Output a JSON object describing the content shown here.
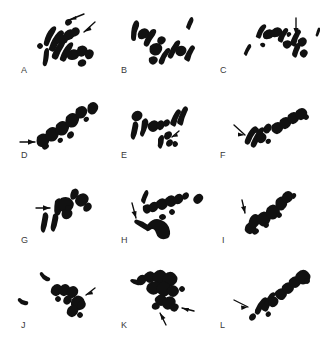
{
  "figure": {
    "width": 330,
    "height": 340,
    "background_color": "#ffffff",
    "ink_color": "#111111",
    "label_color": "#3a3a3a",
    "grid": {
      "columns": 3,
      "rows": 4
    },
    "panel_count": 12
  },
  "panels": [
    {
      "id": "A",
      "label": "A",
      "label_x": 21,
      "label_y": 72,
      "origin_x": 0,
      "origin_y": 0,
      "arrow_count": 2,
      "chromosome_count": 14,
      "spread_angle_deg": -32,
      "description": "metaphase chromosome spread with two arrows indicating marker chromosomes"
    },
    {
      "id": "B",
      "label": "B",
      "label_x": 121,
      "label_y": 72,
      "origin_x": 110,
      "origin_y": 0,
      "arrow_count": 0,
      "chromosome_count": 11,
      "spread_angle_deg": -28,
      "description": "metaphase chromosome spread, scattered elements"
    },
    {
      "id": "C",
      "label": "C",
      "label_x": 220,
      "label_y": 72,
      "origin_x": 220,
      "origin_y": 0,
      "arrow_count": 1,
      "chromosome_count": 13,
      "spread_angle_deg": -25,
      "description": "metaphase chromosome spread with one downward arrow"
    },
    {
      "id": "D",
      "label": "D",
      "label_x": 21,
      "label_y": 155,
      "origin_x": 0,
      "origin_y": 85,
      "arrow_count": 1,
      "chromosome_count": 10,
      "spread_angle_deg": -38,
      "description": "metaphase chromosome spread with one horizontal arrow from left"
    },
    {
      "id": "E",
      "label": "E",
      "label_x": 121,
      "label_y": 155,
      "origin_x": 110,
      "origin_y": 85,
      "arrow_count": 1,
      "chromosome_count": 12,
      "spread_angle_deg": -20,
      "description": "metaphase chromosome spread with small arrow at lower right"
    },
    {
      "id": "F",
      "label": "F",
      "label_x": 220,
      "label_y": 155,
      "origin_x": 220,
      "origin_y": 85,
      "arrow_count": 1,
      "chromosome_count": 11,
      "spread_angle_deg": -30,
      "description": "metaphase chromosome spread with diagonal arrow from lower left"
    },
    {
      "id": "G",
      "label": "G",
      "label_x": 21,
      "label_y": 240,
      "origin_x": 0,
      "origin_y": 170,
      "arrow_count": 1,
      "chromosome_count": 9,
      "spread_angle_deg": -15,
      "description": "metaphase chromosome spread with horizontal arrow from left"
    },
    {
      "id": "H",
      "label": "H",
      "label_x": 121,
      "label_y": 240,
      "origin_x": 110,
      "origin_y": 170,
      "arrow_count": 2,
      "chromosome_count": 12,
      "spread_angle_deg": -22,
      "description": "metaphase chromosome spread with downward arrow and large curved marker"
    },
    {
      "id": "I",
      "label": "I",
      "label_x": 222,
      "label_y": 240,
      "origin_x": 220,
      "origin_y": 170,
      "arrow_count": 1,
      "chromosome_count": 10,
      "spread_angle_deg": -40,
      "description": "metaphase chromosome spread with short downward arrow"
    },
    {
      "id": "J",
      "label": "J",
      "label_x": 21,
      "label_y": 322,
      "origin_x": 0,
      "origin_y": 255,
      "arrow_count": 1,
      "chromosome_count": 11,
      "spread_angle_deg": -35,
      "description": "metaphase chromosome spread with arrow at right side"
    },
    {
      "id": "K",
      "label": "K",
      "label_x": 121,
      "label_y": 322,
      "origin_x": 110,
      "origin_y": 255,
      "arrow_count": 2,
      "chromosome_count": 13,
      "spread_angle_deg": -30,
      "description": "metaphase chromosome spread with two arrows at lower right"
    },
    {
      "id": "L",
      "label": "L",
      "label_x": 220,
      "label_y": 322,
      "origin_x": 220,
      "origin_y": 255,
      "arrow_count": 1,
      "chromosome_count": 11,
      "spread_angle_deg": -34,
      "description": "metaphase chromosome spread with arrow from left"
    }
  ]
}
